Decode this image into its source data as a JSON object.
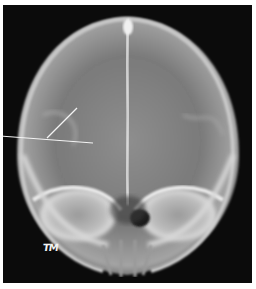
{
  "image": {
    "subject": "skull x-ray, frontal (PA) view",
    "marker_text": "TM",
    "annotation": "two pointer lines on left frontal region"
  },
  "colors": {
    "border": "#ffffff",
    "background": "#0b0b0b",
    "bone": "#d8d8d8",
    "pointer": "#f4f4f4"
  }
}
